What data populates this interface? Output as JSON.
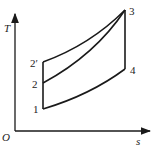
{
  "diagram": {
    "type": "T-s diagram",
    "axes": {
      "y_label": "T",
      "x_label": "s",
      "origin_label": "O"
    },
    "points": [
      {
        "id": "1",
        "label": "1"
      },
      {
        "id": "2",
        "label": "2"
      },
      {
        "id": "2p",
        "label": "2′"
      },
      {
        "id": "3",
        "label": "3"
      },
      {
        "id": "4",
        "label": "4"
      }
    ],
    "line_color": "#1a1a1a"
  }
}
